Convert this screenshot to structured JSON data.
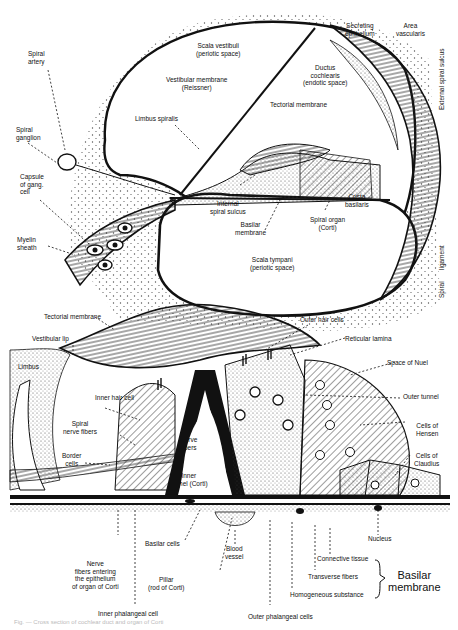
{
  "figure": {
    "top_panel": {
      "title": "Cochlear duct cross-section",
      "labels": {
        "scala_vestibuli": "Scala vestibuli\n(periotic space)",
        "vestibular_membrane": "Vestibular membrane\n(Reissner)",
        "ductus_cochlearis": "Ductus\ncochlearis\n(endotic space)",
        "secreting_epithelium": "Secreting\nepithelium",
        "area_vascularis": "Area\nvascularis",
        "external_spiral_sulcus": "External spiral sulcus",
        "spiral_ligament_1": "Spiral",
        "spiral_ligament_2": "ligament",
        "spiral_artery": "Spiral\nartery",
        "limbus_spiralis": "Limbus spiralis",
        "tectorial_membrane": "Tectorial membrane",
        "spiral_ganglion": "Spiral\nganglion",
        "capsule_of_gang_cell": "Capsule\nof gang.\ncell",
        "internal_spiral_sulcus": "Internal\nspiral sulcus",
        "crista_basilaris": "Crista\nbasilaris",
        "basilar_membrane": "Basilar\nmembrane",
        "spiral_organ": "Spiral organ\n(Corti)",
        "myelin_sheath": "Myelin\nsheath",
        "scala_tympani": "Scala tympani\n(periotic space)"
      }
    },
    "bottom_panel": {
      "title": "Organ of Corti detail",
      "labels": {
        "tectorial_membrane": "Tectorial membrane",
        "outer_hair_cells": "Outer hair cells",
        "vestibular_lip": "Vestibular lip",
        "reticular_lamina": "Reticular lamina",
        "limbus": "Limbus",
        "space_of_nuel": "Space of Nuel",
        "outer_tunnel": "Outer tunnel",
        "inner_hair_cell": "Inner hair cell",
        "spiral_nerve_fibers": "Spiral\nnerve fibers",
        "nerve_fibers": "Nerve\nfibers",
        "cells_of_hensen": "Cells of\nHensen",
        "border_cells": "Border\ncells",
        "inner_tunnel": "Inner\ntunnel (Corti)",
        "cells_of_claudius": "Cells of\nClaudius",
        "nucleus": "Nucleus",
        "connective_tissue": "Connective tissue",
        "basilar_cells": "Basilar cells",
        "blood_vessel": "Blood\nvessel",
        "nerve_fibers_entering": "Nerve\nfibers entering\nthe epithelium\nof organ of Corti",
        "transverse_fibers": "Transverse fibers",
        "basilar_membrane_group": "Basilar\nmembrane",
        "pillar": "Pillar\n(rod of Corti)",
        "homogeneous_substance": "Homogeneous substance",
        "inner_phalangeal_cell": "Inner phalangeal cell",
        "outer_phalangeal_cells": "Outer phalangeal cells"
      }
    },
    "caption": "Fig. — Cross section of cochlear duct and organ of Corti"
  }
}
